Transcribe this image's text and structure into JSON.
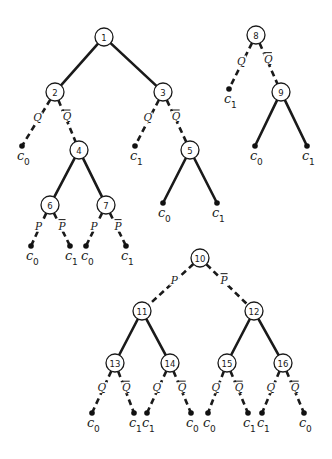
{
  "diagram": {
    "type": "decision-tree-diagram",
    "background": "#ffffff",
    "ink_color": "#1a1a1a",
    "nodes": [
      {
        "id": "1",
        "label": "1",
        "x": 104,
        "y": 37
      },
      {
        "id": "2",
        "label": "2",
        "x": 55,
        "y": 92
      },
      {
        "id": "3",
        "label": "3",
        "x": 163,
        "y": 92
      },
      {
        "id": "4",
        "label": "4",
        "x": 79,
        "y": 150
      },
      {
        "id": "5",
        "label": "5",
        "x": 190,
        "y": 150
      },
      {
        "id": "6",
        "label": "6",
        "x": 50,
        "y": 205
      },
      {
        "id": "7",
        "label": "7",
        "x": 106,
        "y": 205
      },
      {
        "id": "8",
        "label": "8",
        "x": 256,
        "y": 35
      },
      {
        "id": "9",
        "label": "9",
        "x": 281,
        "y": 92
      },
      {
        "id": "10",
        "label": "10",
        "x": 200,
        "y": 258
      },
      {
        "id": "11",
        "label": "11",
        "x": 142,
        "y": 311
      },
      {
        "id": "12",
        "label": "12",
        "x": 254,
        "y": 311
      },
      {
        "id": "13",
        "label": "13",
        "x": 115,
        "y": 363
      },
      {
        "id": "14",
        "label": "14",
        "x": 170,
        "y": 363
      },
      {
        "id": "15",
        "label": "15",
        "x": 227,
        "y": 363
      },
      {
        "id": "16",
        "label": "16",
        "x": 283,
        "y": 363
      }
    ],
    "leaves": [
      {
        "id": "L2a",
        "label": "c",
        "sub": "0",
        "x": 22,
        "y": 146
      },
      {
        "id": "L3a",
        "label": "c",
        "sub": "1",
        "x": 135,
        "y": 146
      },
      {
        "id": "L6a",
        "label": "c",
        "sub": "0",
        "x": 31,
        "y": 246
      },
      {
        "id": "L6b",
        "label": "c",
        "sub": "1",
        "x": 70,
        "y": 246
      },
      {
        "id": "L7a",
        "label": "c",
        "sub": "0",
        "x": 86,
        "y": 246
      },
      {
        "id": "L7b",
        "label": "c",
        "sub": "1",
        "x": 126,
        "y": 246
      },
      {
        "id": "L5a",
        "label": "c",
        "sub": "0",
        "x": 163,
        "y": 203
      },
      {
        "id": "L5b",
        "label": "c",
        "sub": "1",
        "x": 217,
        "y": 203
      },
      {
        "id": "L8a",
        "label": "c",
        "sub": "1",
        "x": 229,
        "y": 89
      },
      {
        "id": "L9a",
        "label": "c",
        "sub": "0",
        "x": 255,
        "y": 146
      },
      {
        "id": "L9b",
        "label": "c",
        "sub": "1",
        "x": 307,
        "y": 146
      },
      {
        "id": "L13a",
        "label": "c",
        "sub": "0",
        "x": 92,
        "y": 413
      },
      {
        "id": "L13b",
        "label": "c",
        "sub": "1",
        "x": 134,
        "y": 413
      },
      {
        "id": "L14a",
        "label": "c",
        "sub": "1",
        "x": 147,
        "y": 413
      },
      {
        "id": "L14b",
        "label": "c",
        "sub": "0",
        "x": 191,
        "y": 413
      },
      {
        "id": "L15a",
        "label": "c",
        "sub": "0",
        "x": 208,
        "y": 413
      },
      {
        "id": "L15b",
        "label": "c",
        "sub": "1",
        "x": 248,
        "y": 413
      },
      {
        "id": "L16a",
        "label": "c",
        "sub": "1",
        "x": 262,
        "y": 413
      },
      {
        "id": "L16b",
        "label": "c",
        "sub": "0",
        "x": 304,
        "y": 413
      }
    ],
    "edges": [
      {
        "from": "1",
        "to": "2",
        "style": "solid",
        "label": ""
      },
      {
        "from": "1",
        "to": "3",
        "style": "solid",
        "label": ""
      },
      {
        "from": "2",
        "to": "L2a",
        "style": "dashed",
        "label": "Q",
        "bar": false
      },
      {
        "from": "2",
        "to": "4",
        "style": "dashed",
        "label": "Q",
        "bar": true
      },
      {
        "from": "3",
        "to": "L3a",
        "style": "dashed",
        "label": "Q",
        "bar": false
      },
      {
        "from": "3",
        "to": "5",
        "style": "dashed",
        "label": "Q",
        "bar": true
      },
      {
        "from": "4",
        "to": "6",
        "style": "solid",
        "label": ""
      },
      {
        "from": "4",
        "to": "7",
        "style": "solid",
        "label": ""
      },
      {
        "from": "5",
        "to": "L5a",
        "style": "solid",
        "label": ""
      },
      {
        "from": "5",
        "to": "L5b",
        "style": "solid",
        "label": ""
      },
      {
        "from": "6",
        "to": "L6a",
        "style": "dashed",
        "label": "P",
        "bar": false
      },
      {
        "from": "6",
        "to": "L6b",
        "style": "dashed",
        "label": "P",
        "bar": true
      },
      {
        "from": "7",
        "to": "L7a",
        "style": "dashed",
        "label": "P",
        "bar": false
      },
      {
        "from": "7",
        "to": "L7b",
        "style": "dashed",
        "label": "P",
        "bar": true
      },
      {
        "from": "8",
        "to": "L8a",
        "style": "dashed",
        "label": "Q",
        "bar": false
      },
      {
        "from": "8",
        "to": "9",
        "style": "dashed",
        "label": "Q",
        "bar": true
      },
      {
        "from": "9",
        "to": "L9a",
        "style": "solid",
        "label": ""
      },
      {
        "from": "9",
        "to": "L9b",
        "style": "solid",
        "label": ""
      },
      {
        "from": "10",
        "to": "11",
        "style": "dashed",
        "label": "P",
        "bar": false
      },
      {
        "from": "10",
        "to": "12",
        "style": "dashed",
        "label": "P",
        "bar": true
      },
      {
        "from": "11",
        "to": "13",
        "style": "solid",
        "label": ""
      },
      {
        "from": "11",
        "to": "14",
        "style": "solid",
        "label": ""
      },
      {
        "from": "12",
        "to": "15",
        "style": "solid",
        "label": ""
      },
      {
        "from": "12",
        "to": "16",
        "style": "solid",
        "label": ""
      },
      {
        "from": "13",
        "to": "L13a",
        "style": "dashed",
        "label": "Q",
        "bar": false
      },
      {
        "from": "13",
        "to": "L13b",
        "style": "dashed",
        "label": "Q",
        "bar": true
      },
      {
        "from": "14",
        "to": "L14a",
        "style": "dashed",
        "label": "Q",
        "bar": false
      },
      {
        "from": "14",
        "to": "L14b",
        "style": "dashed",
        "label": "Q",
        "bar": true
      },
      {
        "from": "15",
        "to": "L15a",
        "style": "dashed",
        "label": "Q",
        "bar": false
      },
      {
        "from": "15",
        "to": "L15b",
        "style": "dashed",
        "label": "Q",
        "bar": true
      },
      {
        "from": "16",
        "to": "L16a",
        "style": "dashed",
        "label": "Q",
        "bar": false
      },
      {
        "from": "16",
        "to": "L16b",
        "style": "dashed",
        "label": "Q",
        "bar": true
      }
    ]
  }
}
